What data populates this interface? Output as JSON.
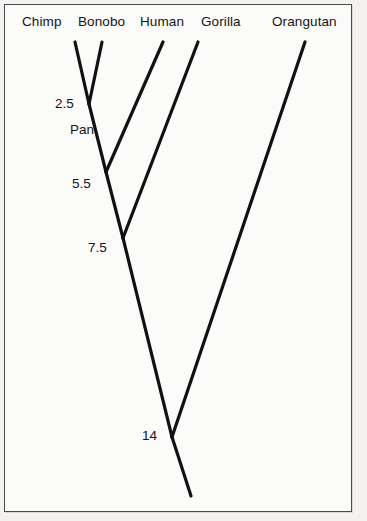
{
  "figure": {
    "background_color": "#f3f2f0",
    "panel_color": "#fbfbfa",
    "border_color": "#4a4a4a",
    "line_color": "#111111"
  },
  "chart_data": {
    "type": "diagram",
    "subtype": "phylogenetic-tree",
    "title": "",
    "orientation": "tips-at-top",
    "units": "million years ago",
    "taxa": [
      {
        "name": "Chimp",
        "label_x": 22,
        "label_y": 14,
        "tip_x": 75,
        "tip_y": 42
      },
      {
        "name": "Bonobo",
        "label_x": 78,
        "label_y": 14,
        "tip_x": 102,
        "tip_y": 42
      },
      {
        "name": "Human",
        "label_x": 140,
        "label_y": 14,
        "tip_x": 163,
        "tip_y": 42
      },
      {
        "name": "Gorilla",
        "label_x": 201,
        "label_y": 14,
        "tip_x": 198,
        "tip_y": 42
      },
      {
        "name": "Orangutan",
        "label_x": 272,
        "label_y": 14,
        "tip_x": 305,
        "tip_y": 42
      }
    ],
    "nodes": [
      {
        "name": "Pan",
        "divergence": "2.5",
        "label": "2.5",
        "label_x": 55,
        "label_y": 96,
        "x": 89,
        "y": 104
      },
      {
        "name": "Pan-clade-name",
        "divergence": null,
        "label": "Pan",
        "label_x": 70,
        "label_y": 122,
        "x": 89,
        "y": 104
      },
      {
        "name": "Homininae-Pan-Human",
        "divergence": "5.5",
        "label": "5.5",
        "label_x": 72,
        "label_y": 176,
        "x": 106,
        "y": 172
      },
      {
        "name": "Homininae-with-Gorilla",
        "divergence": "7.5",
        "label": "7.5",
        "label_x": 88,
        "label_y": 240,
        "x": 123,
        "y": 238
      },
      {
        "name": "Hominidae-root",
        "divergence": "14",
        "label": "14",
        "label_x": 142,
        "label_y": 428,
        "x": 172,
        "y": 437
      }
    ],
    "root": {
      "x": 191,
      "y": 496
    },
    "edges": [
      {
        "from": "Chimp",
        "to": "Pan",
        "x1": 75,
        "y1": 42,
        "x2": 89,
        "y2": 104
      },
      {
        "from": "Bonobo",
        "to": "Pan",
        "x1": 102,
        "y1": 42,
        "x2": 89,
        "y2": 104
      },
      {
        "from": "Pan",
        "to": "Homininae-Pan-Human",
        "x1": 89,
        "y1": 104,
        "x2": 106,
        "y2": 172
      },
      {
        "from": "Human",
        "to": "Homininae-Pan-Human",
        "x1": 163,
        "y1": 42,
        "x2": 106,
        "y2": 172
      },
      {
        "from": "Homininae-Pan-Human",
        "to": "Homininae-with-Gorilla",
        "x1": 106,
        "y1": 172,
        "x2": 123,
        "y2": 238
      },
      {
        "from": "Gorilla",
        "to": "Homininae-with-Gorilla",
        "x1": 198,
        "y1": 42,
        "x2": 123,
        "y2": 238
      },
      {
        "from": "Homininae-with-Gorilla",
        "to": "Hominidae-root",
        "x1": 123,
        "y1": 238,
        "x2": 172,
        "y2": 437
      },
      {
        "from": "Orangutan",
        "to": "Hominidae-root",
        "x1": 305,
        "y1": 42,
        "x2": 172,
        "y2": 437
      },
      {
        "from": "Hominidae-root",
        "to": "root-stem",
        "x1": 172,
        "y1": 437,
        "x2": 191,
        "y2": 496
      }
    ]
  }
}
